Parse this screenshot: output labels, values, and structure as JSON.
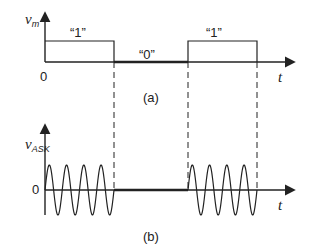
{
  "diagram": {
    "panel_a": {
      "caption": "(a)",
      "y_label_main": "v",
      "y_label_sub": "m",
      "x_label": "t",
      "origin_label": "0",
      "bits": [
        {
          "label": "“1”",
          "value": 1
        },
        {
          "label": "“0”",
          "value": 0
        },
        {
          "label": "“1”",
          "value": 1
        }
      ]
    },
    "panel_b": {
      "caption": "(b)",
      "y_label_main": "v",
      "y_label_sub": "ASK",
      "x_label": "t",
      "origin_label": "0",
      "cycles_per_bit": 4
    },
    "colors": {
      "line": "#222222",
      "background": "#ffffff"
    }
  }
}
